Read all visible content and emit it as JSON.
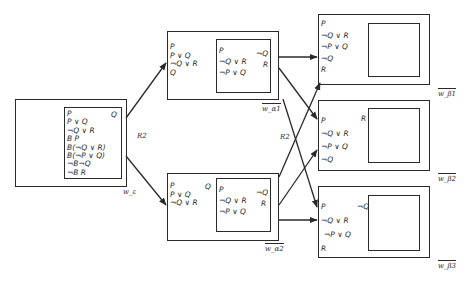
{
  "diagram": {
    "relation_labels": [
      "R2",
      "R2"
    ],
    "worlds": {
      "w_eps": {
        "label": "w_ε",
        "outer_formulas": [],
        "inner_formulas": [
          "P",
          "P ∨ Q",
          "¬Q ∨ R",
          "B P",
          "B(¬Q ∨ R)",
          "B(¬P ∨ Q)",
          "¬B¬Q",
          "¬B R"
        ],
        "inner_right": [
          "Q"
        ]
      },
      "w_a1": {
        "label": "w_α1",
        "outer_formulas": [
          "P",
          "P ∨ Q",
          "¬Q ∨ R",
          "Q"
        ],
        "inner_formulas": [
          "P",
          "¬Q ∨ R",
          "¬P ∨ Q"
        ],
        "inner_right": [
          "¬Q",
          "R"
        ]
      },
      "w_a2": {
        "label": "w_α2",
        "outer_formulas": [
          "P",
          "P ∨ Q",
          "¬Q ∨ R"
        ],
        "outer_right": [
          "Q"
        ],
        "inner_formulas": [
          "P",
          "¬Q ∨ R",
          "¬P ∨ Q"
        ],
        "inner_right": [
          "¬Q",
          "R"
        ]
      },
      "w_b1": {
        "label": "w_β1",
        "outer_formulas": [
          "P",
          "¬Q ∨ R",
          "¬P ∨ Q",
          "¬Q",
          "R"
        ],
        "inner_formulas": []
      },
      "w_b2": {
        "label": "w_β2",
        "outer_formulas": [
          "P",
          "¬Q ∨ R",
          "¬P ∨ Q",
          "¬Q"
        ],
        "outer_right": [
          "R"
        ],
        "inner_formulas": []
      },
      "w_b3": {
        "label": "w_β3",
        "outer_formulas": [
          "P",
          "¬Q ∨ R",
          "¬P ∨ Q",
          "R"
        ],
        "outer_right": [
          "¬Q"
        ],
        "inner_formulas": []
      }
    },
    "edges": [
      {
        "from": "w_ε",
        "to": "w_α1",
        "label": "R2"
      },
      {
        "from": "w_ε",
        "to": "w_α2",
        "label": "R2"
      },
      {
        "from": "w_α1",
        "to": "w_β1"
      },
      {
        "from": "w_α1",
        "to": "w_β2"
      },
      {
        "from": "w_α1",
        "to": "w_β3"
      },
      {
        "from": "w_α2",
        "to": "w_β1"
      },
      {
        "from": "w_α2",
        "to": "w_β2"
      },
      {
        "from": "w_α2",
        "to": "w_β3"
      }
    ]
  }
}
